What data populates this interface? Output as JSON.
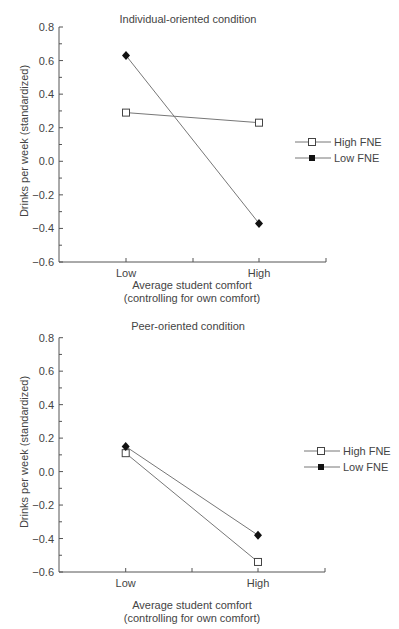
{
  "chart_data": [
    {
      "type": "line",
      "title": "Individual-oriented condition",
      "xlabel": "Average student comfort",
      "xlabel_sub": "(controlling for own comfort)",
      "ylabel": "Drinks per week (standardized)",
      "categories": [
        "Low",
        "High"
      ],
      "ylim": [
        -0.6,
        0.8
      ],
      "yticks": [
        0.8,
        0.6,
        0.4,
        0.2,
        0.0,
        -0.2,
        -0.4,
        -0.6
      ],
      "ytick_labels": [
        "0.8",
        "0.6",
        "0.4",
        "0.2",
        "0.0",
        "−0.2",
        "−0.4",
        "−0.6"
      ],
      "grid": false,
      "legend_position": "right",
      "series": [
        {
          "name": "High FNE",
          "marker": "open-square",
          "values": [
            0.29,
            0.23
          ]
        },
        {
          "name": "Low FNE",
          "marker": "filled-diamond",
          "values": [
            0.63,
            -0.37
          ]
        }
      ]
    },
    {
      "type": "line",
      "title": "Peer-oriented condition",
      "xlabel": "Average student comfort",
      "xlabel_sub": "(controlling for own comfort)",
      "ylabel": "Drinks per week (standardized)",
      "categories": [
        "Low",
        "High"
      ],
      "ylim": [
        -0.6,
        0.8
      ],
      "yticks": [
        0.8,
        0.6,
        0.4,
        0.2,
        0.0,
        -0.2,
        -0.4,
        -0.6
      ],
      "ytick_labels": [
        "0.8",
        "0.6",
        "0.4",
        "0.2",
        "0.0",
        "−0.2",
        "−0.4",
        "−0.6"
      ],
      "grid": false,
      "legend_position": "right",
      "series": [
        {
          "name": "High FNE",
          "marker": "open-square",
          "values": [
            0.11,
            -0.54
          ]
        },
        {
          "name": "Low FNE",
          "marker": "filled-diamond",
          "values": [
            0.15,
            -0.38
          ]
        }
      ]
    }
  ],
  "colors": {
    "axis": "#555555",
    "line": "#777777",
    "text": "#444444",
    "marker_fill": "#111111"
  }
}
